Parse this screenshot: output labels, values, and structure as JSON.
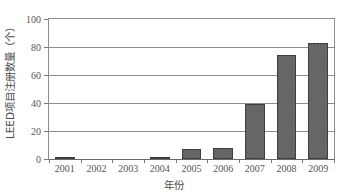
{
  "chart_data": {
    "type": "bar",
    "title": "",
    "subtitle": "",
    "xlabel": "年份",
    "ylabel": "LEED项目注册数量（个）",
    "categories": [
      "2001",
      "2002",
      "2003",
      "2004",
      "2005",
      "2006",
      "2007",
      "2008",
      "2009"
    ],
    "values": [
      1,
      0,
      0,
      1,
      7,
      8,
      39,
      74,
      83
    ],
    "ylim": [
      0,
      100
    ],
    "yticks": [
      0,
      20,
      40,
      60,
      80,
      100
    ],
    "ytick_labels": [
      "0",
      "20",
      "40",
      "60",
      "80",
      "100"
    ],
    "grid": "horizontal",
    "legend": "none",
    "series": [
      {
        "name": "LEED项目注册数量",
        "values": [
          1,
          0,
          0,
          1,
          7,
          8,
          39,
          74,
          83
        ]
      }
    ],
    "colors": {
      "bar_fill": "#575757",
      "bar_edge": "#3f3f3f",
      "gridline": "#8d8d8d",
      "axis": "#6b6b6b",
      "tick_text": "#555555",
      "axis_title_text": "#4a4a4a",
      "background": "#ffffff"
    }
  }
}
